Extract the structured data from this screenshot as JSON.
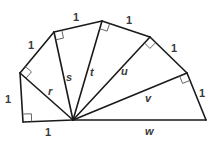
{
  "colors": {
    "stroke": "#1a1a1a",
    "label": "#3a3a3a",
    "right_angle_marker": "#555555",
    "background": "#ffffff"
  },
  "unit_labels": {
    "bottom_leg": "1",
    "left_leg": "1",
    "edge_2": "1",
    "edge_3": "1",
    "edge_4": "1",
    "edge_5": "1",
    "edge_6": "1"
  },
  "hypotenuse_labels": {
    "r": "r",
    "s": "s",
    "t": "t",
    "u": "u",
    "v": "v",
    "w": "w"
  }
}
